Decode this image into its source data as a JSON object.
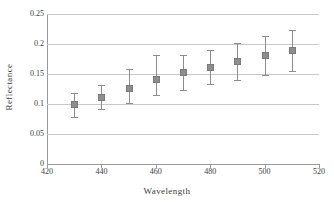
{
  "chart_data": {
    "type": "scatter",
    "title": "",
    "xlabel": "Wavelength",
    "ylabel": "Reflectance",
    "xlim": [
      420,
      520
    ],
    "ylim": [
      0,
      0.25
    ],
    "grid": true,
    "legend": "none",
    "error_bars": "vertical",
    "marker": "square",
    "marker_color": "#8e8e8e",
    "errorbar_color": "#8d8d8d",
    "gridline_color": "#c8c8c8",
    "x": [
      430,
      440,
      450,
      460,
      470,
      480,
      490,
      500,
      510
    ],
    "y": [
      0.099,
      0.111,
      0.126,
      0.141,
      0.152,
      0.161,
      0.171,
      0.181,
      0.189
    ],
    "yerr_low": [
      0.079,
      0.091,
      0.102,
      0.115,
      0.124,
      0.133,
      0.14,
      0.149,
      0.155
    ],
    "yerr_high": [
      0.119,
      0.132,
      0.158,
      0.182,
      0.181,
      0.19,
      0.201,
      0.213,
      0.223
    ],
    "xticks": [
      420,
      440,
      460,
      480,
      500,
      520
    ],
    "xtick_labels": [
      "420",
      "440",
      "460",
      "480",
      "500",
      "520"
    ],
    "yticks": [
      0,
      0.05,
      0.1,
      0.15,
      0.2,
      0.25
    ],
    "ytick_labels": [
      "0",
      "0.05",
      "0.1",
      "0.15",
      "0.2",
      "0.25"
    ]
  }
}
